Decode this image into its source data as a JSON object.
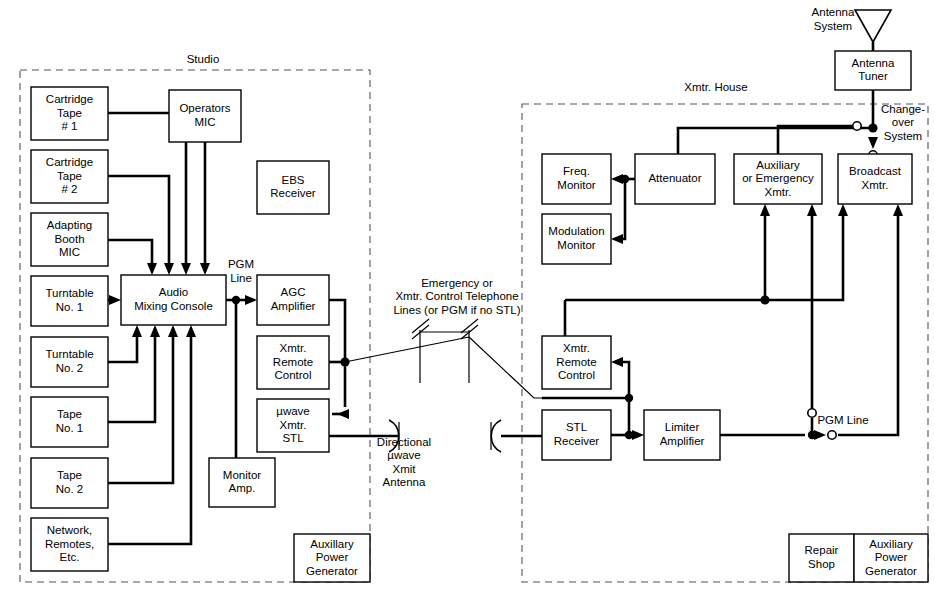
{
  "diagram": {
    "zones": [
      {
        "name": "studio",
        "label": "Studio"
      },
      {
        "name": "xmtr-house",
        "label": "Xmtr. House"
      }
    ],
    "studio_boxes": [
      {
        "name": "cartridge-tape-1",
        "lines": [
          "Cartridge",
          "Tape",
          "# 1"
        ],
        "x": 31,
        "y": 87,
        "w": 77,
        "h": 53
      },
      {
        "name": "cartridge-tape-2",
        "lines": [
          "Cartridge",
          "Tape",
          "# 2"
        ],
        "x": 31,
        "y": 150,
        "w": 77,
        "h": 53
      },
      {
        "name": "adapting-booth-mic",
        "lines": [
          "Adapting",
          "Booth",
          "MIC"
        ],
        "x": 31,
        "y": 213,
        "w": 77,
        "h": 53
      },
      {
        "name": "turntable-1",
        "lines": [
          "Turntable",
          "No. 1"
        ],
        "x": 31,
        "y": 276,
        "w": 77,
        "h": 50
      },
      {
        "name": "turntable-2",
        "lines": [
          "Turntable",
          "No. 2"
        ],
        "x": 31,
        "y": 337,
        "w": 77,
        "h": 50
      },
      {
        "name": "tape-1",
        "lines": [
          "Tape",
          "No. 1"
        ],
        "x": 31,
        "y": 397,
        "w": 77,
        "h": 50
      },
      {
        "name": "tape-2",
        "lines": [
          "Tape",
          "No. 2"
        ],
        "x": 31,
        "y": 458,
        "w": 77,
        "h": 50
      },
      {
        "name": "network-remotes-etc",
        "lines": [
          "Network,",
          "Remotes,",
          "Etc."
        ],
        "x": 31,
        "y": 518,
        "w": 77,
        "h": 53
      },
      {
        "name": "operators-mic",
        "lines": [
          "Operators",
          "MIC"
        ],
        "x": 169,
        "y": 90,
        "w": 72,
        "h": 52
      },
      {
        "name": "ebs-receiver",
        "lines": [
          "EBS",
          "Receiver"
        ],
        "x": 257,
        "y": 161,
        "w": 72,
        "h": 53
      },
      {
        "name": "audio-mixing-console",
        "lines": [
          "Audio",
          "Mixing Console"
        ],
        "x": 121,
        "y": 275,
        "w": 105,
        "h": 50
      },
      {
        "name": "agc-amplifier",
        "lines": [
          "AGC",
          "Amplifier"
        ],
        "x": 257,
        "y": 275,
        "w": 72,
        "h": 50
      },
      {
        "name": "xmtr-remote-control-studio",
        "lines": [
          "Xmtr.",
          "Remote",
          "Control"
        ],
        "x": 257,
        "y": 336,
        "w": 72,
        "h": 53
      },
      {
        "name": "uwave-xmtr-stl",
        "lines": [
          "µwave",
          "Xmtr.",
          "STL"
        ],
        "x": 257,
        "y": 399,
        "w": 72,
        "h": 53
      },
      {
        "name": "monitor-amp",
        "lines": [
          "Monitor",
          "Amp."
        ],
        "x": 209,
        "y": 458,
        "w": 66,
        "h": 49
      },
      {
        "name": "studio-auxiliary-power-generator",
        "lines": [
          "Auxillary",
          "Power",
          "Generator"
        ],
        "x": 294,
        "y": 534,
        "w": 76,
        "h": 48
      }
    ],
    "xmtr_boxes": [
      {
        "name": "antenna-tuner",
        "lines": [
          "Antenna",
          "Tuner"
        ],
        "x": 835,
        "y": 51,
        "w": 76,
        "h": 39
      },
      {
        "name": "freq-monitor",
        "lines": [
          "Freq.",
          "Monitor"
        ],
        "x": 542,
        "y": 154,
        "w": 69,
        "h": 50
      },
      {
        "name": "modulation-monitor",
        "lines": [
          "Modulation",
          "Monitor"
        ],
        "x": 542,
        "y": 214,
        "w": 69,
        "h": 50
      },
      {
        "name": "attenuator",
        "lines": [
          "Attenuator"
        ],
        "x": 635,
        "y": 154,
        "w": 80,
        "h": 50
      },
      {
        "name": "auxiliary-or-emergency-xmtr",
        "lines": [
          "Auxiliary",
          "or Emergency",
          "Xmtr."
        ],
        "x": 734,
        "y": 154,
        "w": 88,
        "h": 50
      },
      {
        "name": "broadcast-xmtr",
        "lines": [
          "Broadcast",
          "Xmtr."
        ],
        "x": 838,
        "y": 154,
        "w": 74,
        "h": 50
      },
      {
        "name": "xmtr-remote-control-house",
        "lines": [
          "Xmtr.",
          "Remote",
          "Control"
        ],
        "x": 542,
        "y": 336,
        "w": 69,
        "h": 53
      },
      {
        "name": "stl-receiver",
        "lines": [
          "STL",
          "Receiver"
        ],
        "x": 542,
        "y": 410,
        "w": 69,
        "h": 50
      },
      {
        "name": "limiter-amplifier",
        "lines": [
          "Limiter",
          "Amplifier"
        ],
        "x": 644,
        "y": 410,
        "w": 76,
        "h": 50
      },
      {
        "name": "repair-shop",
        "lines": [
          "Repair",
          "Shop"
        ],
        "x": 789,
        "y": 534,
        "w": 65,
        "h": 48
      },
      {
        "name": "auxiliary-power-generator",
        "lines": [
          "Auxiliary",
          "Power",
          "Generator"
        ],
        "x": 854,
        "y": 534,
        "w": 74,
        "h": 48
      }
    ],
    "free_labels": [
      {
        "name": "label-studio-zone",
        "lines": [
          "Studio"
        ],
        "x": 203,
        "y": 60
      },
      {
        "name": "label-xmtr-house-zone",
        "lines": [
          "Xmtr. House"
        ],
        "x": 716,
        "y": 88
      },
      {
        "name": "label-antenna-system",
        "lines": [
          "Antenna",
          "System"
        ],
        "x": 833,
        "y": 20
      },
      {
        "name": "label-changeover-system",
        "lines": [
          "Change-",
          "over",
          "System"
        ],
        "x": 903,
        "y": 123
      },
      {
        "name": "label-pgm-line-studio",
        "lines": [
          "PGM",
          "Line"
        ],
        "x": 241,
        "y": 272
      },
      {
        "name": "label-pgm-line-xmtr",
        "lines": [
          "PGM Line"
        ],
        "x": 843,
        "y": 421
      },
      {
        "name": "label-telephone-lines",
        "lines": [
          "Emergency or",
          "Xmtr. Control Telephone",
          "Lines (or PGM if no STL)"
        ],
        "x": 457,
        "y": 297
      },
      {
        "name": "label-directional-antenna",
        "lines": [
          "Directional",
          "µwave",
          "Xmit",
          "Antenna"
        ],
        "x": 404,
        "y": 463
      }
    ],
    "colors": {
      "wire": "#000000",
      "box_stroke": "#000000",
      "zone_dash": "#555555",
      "background": "#ffffff"
    }
  }
}
